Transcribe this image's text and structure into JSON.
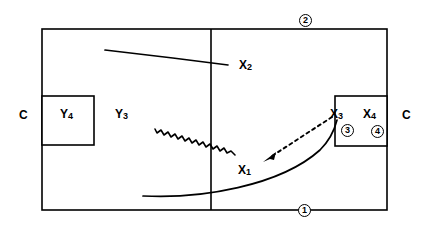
{
  "diagram": {
    "title": "",
    "background_color": "#ffffff",
    "line_color": "#000000",
    "labels": {
      "x1": "X",
      "x1_sub": "1",
      "x2": "X",
      "x2_sub": "2",
      "x3": "X",
      "x3_sub": "3",
      "x4": "X",
      "x4_sub": "4",
      "y3": "Y",
      "y3_sub": "3",
      "y4": "Y",
      "y4_sub": "4",
      "c_left": "C",
      "c_right": "C"
    },
    "circled_markers": {
      "one": "1",
      "two": "2",
      "three": "3",
      "four": "4"
    },
    "shapes": {
      "outer_rectangle": "main-enclosure",
      "divider": "vertical-midline",
      "left_inner_box": "y4-compartment",
      "right_inner_box": "x3-x4-compartment",
      "curve_x2": "smooth-curve-upper",
      "curve_x1": "wavy-line-middle",
      "curve_bottom": "smooth-curve-lower",
      "arrow": "dashed-arrow-pointing-left"
    }
  }
}
